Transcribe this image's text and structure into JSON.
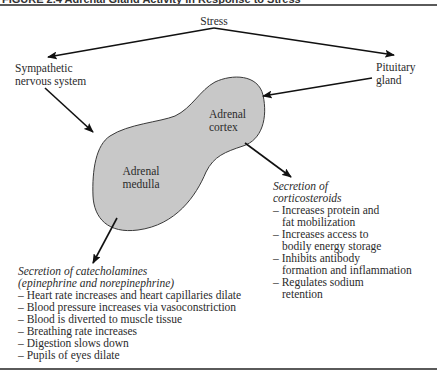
{
  "figure": {
    "header_text": "FIGURE 2.4 Adrenal Gland Activity in Response to Stress"
  },
  "nodes": {
    "stress": "Stress",
    "sympathetic": [
      "Sympathetic",
      "nervous system"
    ],
    "pituitary": [
      "Pituitary",
      "gland"
    ],
    "cortex": [
      "Adrenal",
      "cortex"
    ],
    "medulla": [
      "Adrenal",
      "medulla"
    ]
  },
  "corticosteroids": {
    "title": [
      "Secretion of",
      "corticosteroids"
    ],
    "items": [
      [
        "Increases protein and",
        "fat mobilization"
      ],
      [
        "Increases access to",
        "bodily energy storage"
      ],
      [
        "Inhibits antibody",
        "formation and inflammation"
      ],
      [
        "Regulates sodium",
        "retention"
      ]
    ]
  },
  "catecholamines": {
    "title": [
      "Secretion of catecholamines",
      "(epinephrine and norepinephrine)"
    ],
    "items": [
      "Heart rate increases and heart capillaries dilate",
      "Blood pressure increases via vasoconstriction",
      "Blood is diverted to muscle tissue",
      "Breathing rate increases",
      "Digestion slows down",
      "Pupils of eyes dilate"
    ]
  },
  "colors": {
    "gland_fill": "#c8c8c8",
    "gland_stroke": "#3a3a3a",
    "arrow": "#111111",
    "rule": "#5a5a5a"
  }
}
